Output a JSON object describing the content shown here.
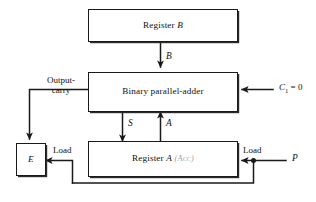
{
  "diagram": {
    "blocks": {
      "register_b": {
        "label": "Register",
        "symbol": "B"
      },
      "adder": {
        "label": "Binary parallel-adder"
      },
      "register_a": {
        "label": "Register",
        "symbol": "A",
        "annotation": "(Acc)"
      },
      "e_flip_flop": {
        "label": "E"
      }
    },
    "signals": {
      "b_bus": "B",
      "sum_bus": "S",
      "a_bus": "A",
      "carry_in_name": "C",
      "carry_in_subscript": "1",
      "carry_in_equals": "= 0",
      "output_carry_line1": "Output-",
      "output_carry_line2": "carry",
      "load_e": "Load",
      "load_a": "Load",
      "p_input": "P"
    },
    "colors": {
      "background": "#ffffff",
      "stroke": "#1a1a1a",
      "text": "#111111",
      "annotation": "#9a9a9a"
    }
  }
}
